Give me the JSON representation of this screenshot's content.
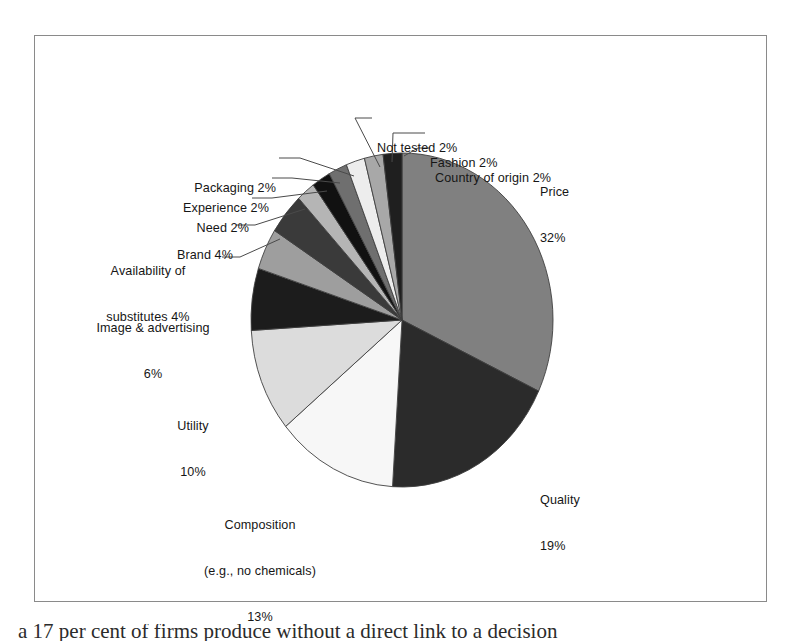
{
  "figure": {
    "background_color": "#ffffff",
    "frame_border_color": "#8a8a8a",
    "caption_partial": "a 17 per cent of firms produce without a direct link to a decision"
  },
  "chart_data": {
    "type": "pie",
    "title": "",
    "subtitle": "",
    "xlabel": "",
    "ylabel": "",
    "legend_position": "none",
    "grid": false,
    "label_format": "name + percent",
    "start_angle_deg": 0,
    "direction": "clockwise",
    "categories": [
      "Price",
      "Quality",
      "Composition (e.g., no chemicals)",
      "Utility",
      "Image & advertising",
      "Availability of substitutes",
      "Brand",
      "Need",
      "Experience",
      "Packaging",
      "Not tested",
      "Fashion",
      "Country of origin"
    ],
    "values": [
      32,
      19,
      13,
      10,
      6,
      4,
      4,
      2,
      2,
      2,
      2,
      2,
      2
    ],
    "units": "percent",
    "total": 100,
    "slices": [
      {
        "name": "Price",
        "value": 32,
        "percent_label": "32%",
        "color": "#808080",
        "label_line1": "Price",
        "label_line2": "32%",
        "has_leader": false
      },
      {
        "name": "Quality",
        "value": 19,
        "percent_label": "19%",
        "color": "#2b2b2b",
        "label_line1": "Quality",
        "label_line2": "19%",
        "has_leader": false
      },
      {
        "name": "Composition",
        "value": 13,
        "percent_label": "13%",
        "color": "#f7f7f7",
        "label_line1": "Composition",
        "label_line2": "(e.g., no chemicals)",
        "label_line3": "13%",
        "has_leader": false
      },
      {
        "name": "Utility",
        "value": 10,
        "percent_label": "10%",
        "color": "#dcdcdc",
        "label_line1": "Utility",
        "label_line2": "10%",
        "has_leader": false
      },
      {
        "name": "Image & advertising",
        "value": 6,
        "percent_label": "6%",
        "color": "#1c1c1c",
        "label_line1": "Image & advertising",
        "label_line2": "6%",
        "has_leader": false
      },
      {
        "name": "Availability of substitutes",
        "value": 4,
        "percent_label": "4%",
        "color": "#9e9e9e",
        "label_line1": "Availability of",
        "label_line2": "substitutes 4%",
        "has_leader": true
      },
      {
        "name": "Brand",
        "value": 4,
        "percent_label": "4%",
        "color": "#3a3a3a",
        "label_line1": "Brand 4%",
        "has_leader": true
      },
      {
        "name": "Need",
        "value": 2,
        "percent_label": "2%",
        "color": "#b5b5b5",
        "label_line1": "Need 2%",
        "has_leader": true
      },
      {
        "name": "Experience",
        "value": 2,
        "percent_label": "2%",
        "color": "#111111",
        "label_line1": "Experience 2%",
        "has_leader": true
      },
      {
        "name": "Packaging",
        "value": 2,
        "percent_label": "2%",
        "color": "#6f6f6f",
        "label_line1": "Packaging 2%",
        "has_leader": true
      },
      {
        "name": "Not tested",
        "value": 2,
        "percent_label": "2%",
        "color": "#ededed",
        "label_line1": "Not tested 2%",
        "has_leader": true
      },
      {
        "name": "Fashion",
        "value": 2,
        "percent_label": "2%",
        "color": "#a8a8a8",
        "label_line1": "Fashion 2%",
        "has_leader": true
      },
      {
        "name": "Country of origin",
        "value": 2,
        "percent_label": "2%",
        "color": "#1f1f1f",
        "label_line1": "Country of origin 2%",
        "has_leader": true
      }
    ]
  },
  "labels": {
    "price": "Price\n32%",
    "quality": "Quality\n19%",
    "composition": "Composition\n(e.g., no chemicals)\n13%",
    "utility": "Utility\n10%",
    "image_advertising": "Image & advertising\n6%",
    "availability": "Availability of\nsubstitutes 4%",
    "brand": "Brand 4%",
    "need": "Need 2%",
    "experience": "Experience 2%",
    "packaging": "Packaging 2%",
    "not_tested": "Not tested 2%",
    "fashion": "Fashion 2%",
    "country_of_origin": "Country of origin 2%"
  }
}
